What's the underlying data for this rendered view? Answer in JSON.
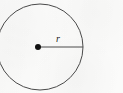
{
  "figure": {
    "kind": "geometry-diagram",
    "background_color": "#fbfbfa",
    "stroke_color": "#4a4a4a",
    "label_color": "#1a1a1a",
    "circle": {
      "center_x": 40,
      "center_y": 47,
      "radius": 43,
      "stroke_width": 1,
      "clipped_edge": "left"
    },
    "center_point": {
      "x": 38,
      "y": 47,
      "diameter": 6,
      "color": "#111111"
    },
    "radius_segment": {
      "from_x": 38,
      "from_y": 47,
      "to_x": 83,
      "to_y": 47,
      "stroke_width": 1
    },
    "labels": {
      "radius": "r"
    },
    "radius_label_position": {
      "x": 58,
      "y": 42
    }
  }
}
